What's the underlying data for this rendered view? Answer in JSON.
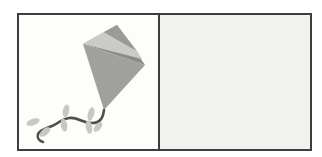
{
  "panels": {
    "left": {
      "name": "kite-panel",
      "content_icon": "kite-with-bow-tail-illustration"
    },
    "right": {
      "name": "empty-panel",
      "content_icon": ""
    }
  },
  "colors": {
    "page_bg": "#ffffff",
    "border": "#3d3d3b",
    "left_panel_bg": "#fdfdfc",
    "right_panel_bg": "#f1f1ef",
    "kite_shadow": "#8b8b89",
    "kite_light": "#cacac6",
    "kite_top": "#9a9a98",
    "kite_body": "#a0a09e",
    "tail": "#4e4e4a",
    "bow": "#c7c7c3"
  }
}
